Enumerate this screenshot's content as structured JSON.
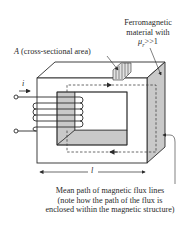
{
  "labels": {
    "material_line1": "Ferromagnetic",
    "material_line2": "material with",
    "material_mu": "μ",
    "material_mu_sub": "r",
    "material_mu_rest": ">>1",
    "area_symbol": "A",
    "area_text": "(cross-sectional area)",
    "current_symbol": "i",
    "length_symbol": "l",
    "caption_line1": "Mean path of magnetic flux lines",
    "caption_line2": "(note how the path of the flux is",
    "caption_line3": "enclosed within the magnetic structure)"
  },
  "colors": {
    "line": "#2b2b2b",
    "shade": "#c9c9c9",
    "shade_dark": "#b5b5b5",
    "background": "#ffffff"
  }
}
